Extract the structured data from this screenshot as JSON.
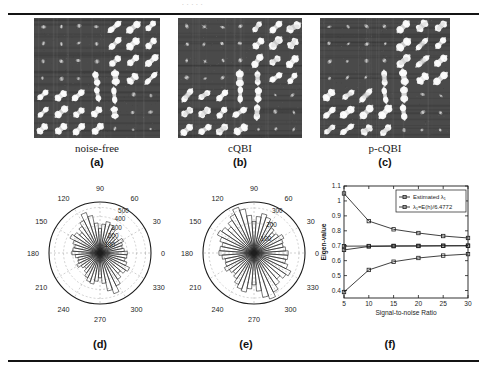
{
  "figure": {
    "top_remnant": ". .   . .     .",
    "panels": [
      {
        "id": "a",
        "caption": "noise-free",
        "sublabel": "(a)",
        "bg_color": "#4a4a4a",
        "grid": "7x7",
        "noise": "none"
      },
      {
        "id": "b",
        "caption": "cQBI",
        "sublabel": "(b)",
        "bg_color": "#4a4a4a",
        "grid": "7x7",
        "noise": "moderate"
      },
      {
        "id": "c",
        "caption": "p-cQBI",
        "sublabel": "(c)",
        "bg_color": "#4a4a4a",
        "grid": "7x7",
        "noise": "low"
      }
    ],
    "sublabels": {
      "d": "(d)",
      "e": "(e)",
      "f": "(f)"
    }
  },
  "chart_data": [
    {
      "id": "d",
      "type": "polar-histogram",
      "title": "",
      "angle_ticks": [
        "0",
        "30",
        "60",
        "90",
        "120",
        "150",
        "180",
        "210",
        "240",
        "270",
        "300",
        "330"
      ],
      "radial_ticks": [
        100,
        200,
        300,
        400,
        500
      ],
      "radial_tick_labels": [
        "100",
        "200",
        "300",
        "400",
        "500"
      ],
      "rlim": [
        0,
        560
      ],
      "bin_count": 48,
      "bin_width_deg": 7.5,
      "values": [
        300,
        268,
        250,
        262,
        288,
        245,
        222,
        258,
        300,
        330,
        352,
        318,
        268,
        330,
        420,
        470,
        398,
        352,
        300,
        340,
        368,
        315,
        285,
        300,
        310,
        272,
        248,
        258,
        285,
        250,
        228,
        262,
        302,
        335,
        348,
        312,
        272,
        335,
        425,
        472,
        402,
        348,
        298,
        338,
        362,
        312,
        282,
        296
      ]
    },
    {
      "id": "e",
      "type": "polar-histogram",
      "title": "",
      "angle_ticks": [
        "0",
        "30",
        "60",
        "90",
        "120",
        "150",
        "180",
        "210",
        "240",
        "270",
        "300",
        "330"
      ],
      "radial_ticks": [
        100,
        200,
        300
      ],
      "radial_tick_labels": [
        "100",
        "200",
        "300"
      ],
      "rlim": [
        0,
        340
      ],
      "bin_count": 48,
      "bin_width_deg": 7.5,
      "values": [
        228,
        212,
        198,
        205,
        222,
        196,
        182,
        204,
        232,
        252,
        268,
        244,
        210,
        252,
        300,
        322,
        288,
        262,
        232,
        258,
        272,
        240,
        218,
        228,
        234,
        214,
        196,
        202,
        220,
        198,
        186,
        206,
        234,
        255,
        266,
        240,
        212,
        255,
        302,
        324,
        290,
        258,
        230,
        256,
        274,
        238,
        216,
        226
      ]
    },
    {
      "id": "f",
      "type": "line",
      "title": "",
      "xlabel": "Signal-to-noise Ratio",
      "ylabel": "Eigen-value",
      "x": [
        5,
        10,
        15,
        20,
        25,
        30
      ],
      "xticks": [
        "5",
        "10",
        "15",
        "20",
        "25",
        "30"
      ],
      "yticks": [
        "0.4",
        "0.5",
        "0.6",
        "0.7",
        "0.8",
        "0.9",
        "1",
        "1.1"
      ],
      "xlim": [
        5,
        30
      ],
      "ylim": [
        0.35,
        1.1
      ],
      "grid": false,
      "legend_position": "top-right",
      "legend": [
        "Estimated λ₁",
        "λ₁=E(h)/6.4772"
      ],
      "series": [
        {
          "name": "lambda-upper",
          "marker": "square",
          "values": [
            1.05,
            0.865,
            0.81,
            0.785,
            0.765,
            0.752
          ]
        },
        {
          "name": "lambda-middle",
          "marker": "square",
          "values": [
            0.697,
            0.698,
            0.699,
            0.699,
            0.7,
            0.7
          ]
        },
        {
          "name": "lambda-lower-estimated",
          "marker": "square",
          "values": [
            0.672,
            0.695,
            0.697,
            0.698,
            0.699,
            0.7
          ]
        },
        {
          "name": "lambda-rising",
          "marker": "square",
          "values": [
            0.39,
            0.538,
            0.593,
            0.618,
            0.634,
            0.644
          ]
        }
      ]
    }
  ]
}
